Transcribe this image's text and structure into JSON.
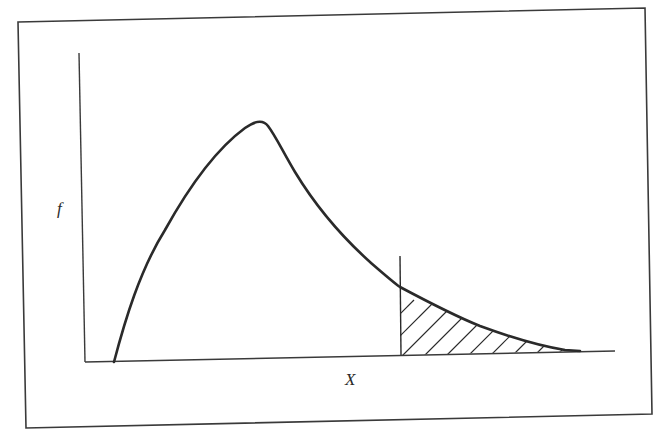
{
  "figure": {
    "type": "right-skewed probability density curve with shaded upper tail",
    "y_axis_label": "f",
    "x_axis_label": "X",
    "colors": {
      "stroke": "#2a2a2a",
      "frame": "#3a3a3a",
      "background": "#ffffff"
    },
    "frame": {
      "top_left": [
        18,
        22
      ],
      "top_right": [
        645,
        8
      ],
      "bottom_right": [
        652,
        414
      ],
      "bottom_left": [
        26,
        428
      ]
    },
    "axes": {
      "origin": [
        85,
        362
      ],
      "y_axis_top": [
        79,
        53
      ],
      "x_axis_end": [
        615,
        351
      ]
    },
    "curve": {
      "start": [
        114,
        362
      ],
      "peak": [
        259,
        122
      ],
      "cutoff_intersection": [
        400,
        287
      ],
      "tail_end": [
        580,
        351
      ]
    },
    "cutoff_line": {
      "x": 400,
      "top_y": 256,
      "bottom_y": 355
    },
    "shaded_region": {
      "pattern": "diagonal-hatch",
      "description": "area under curve to the right of cutoff"
    }
  }
}
